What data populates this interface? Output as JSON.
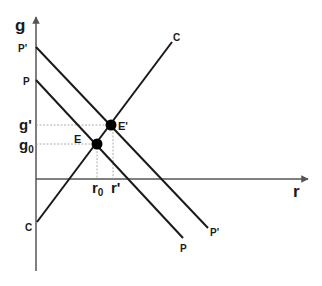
{
  "diagram": {
    "type": "economic-equilibrium-diagram",
    "axes": {
      "x_label": "r",
      "y_label": "g"
    },
    "curves": [
      {
        "id": "C",
        "label_start": "C",
        "label_end": "C",
        "slope": "upward"
      },
      {
        "id": "P",
        "label_start": "P",
        "label_end": "P",
        "slope": "downward"
      },
      {
        "id": "P_prime",
        "label_start": "P'",
        "label_end": "P'",
        "slope": "downward"
      }
    ],
    "equilibria": [
      {
        "id": "E",
        "label": "E",
        "x_tick": "r",
        "x_tick_sub": "0",
        "y_tick": "g",
        "y_tick_sub": "0"
      },
      {
        "id": "E_prime",
        "label": "E'",
        "x_tick": "r'",
        "y_tick": "g'"
      }
    ],
    "colors": {
      "line": "#1a1a1a",
      "guide": "#9a9a9a",
      "background": "#ffffff"
    }
  }
}
